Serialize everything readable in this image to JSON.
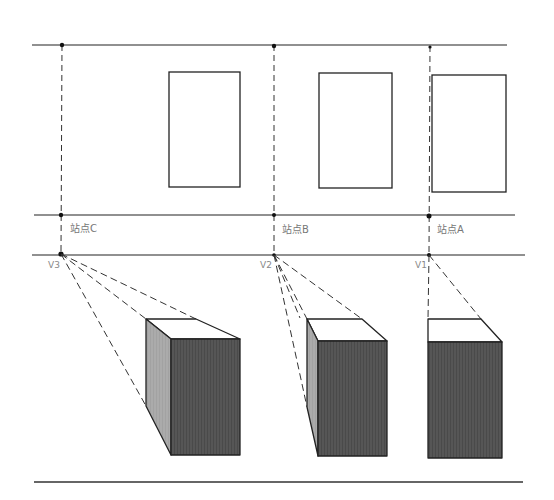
{
  "diagram": {
    "type": "one-point perspective construction (plan view with station points, vanishing points, rendered boxes)",
    "colors": {
      "line": "#222222",
      "dashed": "#333333",
      "side_face": "#a9a9a9",
      "front_face": "#555555",
      "top_face": "#ffffff",
      "label": "#777777"
    },
    "lines": {
      "picture_plane_top": {
        "y": 45,
        "x1": 32,
        "x2": 507
      },
      "station_line": {
        "y": 215,
        "x1": 34,
        "x2": 515
      },
      "horizon_line": {
        "y": 255,
        "x1": 32,
        "x2": 525
      },
      "ground_line": {
        "y": 482,
        "x1": 34,
        "x2": 523
      }
    },
    "stations": [
      {
        "label": "站点C",
        "x": 62,
        "label_x": 70,
        "label_y": 231
      },
      {
        "label": "站点B",
        "x": 274,
        "label_x": 282,
        "label_y": 232
      },
      {
        "label": "站点A",
        "x": 429,
        "label_x": 437,
        "label_y": 232
      }
    ],
    "vanishing_points": [
      {
        "label": "V3",
        "x": 61,
        "y": 254,
        "label_x": 48,
        "label_y": 268
      },
      {
        "label": "V2",
        "x": 274,
        "y": 255,
        "label_x": 260,
        "label_y": 268
      },
      {
        "label": "V1",
        "x": 429,
        "y": 255,
        "label_x": 415,
        "label_y": 268
      }
    ],
    "plan_rects": [
      {
        "name": "C",
        "x": 169,
        "y": 72,
        "w": 71,
        "h": 115
      },
      {
        "name": "B",
        "x": 319,
        "y": 73,
        "w": 73,
        "h": 115
      },
      {
        "name": "A",
        "x": 432,
        "y": 75,
        "w": 74,
        "h": 117
      }
    ],
    "boxes": [
      {
        "name": "C",
        "vp": "V3",
        "back_left": [
          146,
          319
        ],
        "back_right": [
          196,
          319
        ],
        "front_tl": [
          171,
          339
        ],
        "front_tr": [
          240,
          339
        ],
        "front_bottom": 455,
        "side_bottom": [
          146,
          406
        ]
      },
      {
        "name": "B",
        "vp": "V2",
        "back_left": [
          307,
          319
        ],
        "back_right": [
          362,
          319
        ],
        "front_tl": [
          318,
          341
        ],
        "front_tr": [
          387,
          341
        ],
        "front_bottom": 456,
        "side_bottom": [
          307,
          407
        ]
      },
      {
        "name": "A",
        "vp": "V1",
        "back_left": [
          428,
          319
        ],
        "back_right": [
          481,
          319
        ],
        "front_tl": [
          428,
          342
        ],
        "front_tr": [
          502,
          342
        ],
        "front_bottom": 458
      }
    ]
  }
}
